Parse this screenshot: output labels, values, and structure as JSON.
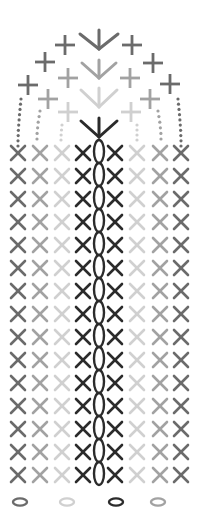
{
  "diagram": {
    "title": "Crochet stitch chart",
    "colors": {
      "darkest": "#2b2b2b",
      "dark": "#6b6b6b",
      "mid": "#a2a2a2",
      "light": "#d0d0d0"
    },
    "symbols": {
      "x": "single-crochet",
      "plus": "single-crochet-variant",
      "v": "increase",
      "chain": "chain-stitch",
      "oval": "chain-loop",
      "dot": "slip-stitch"
    },
    "grid": {
      "rows": 15,
      "first_row_y": 153,
      "row_spacing": 23,
      "x_columns": [
        {
          "x": 18,
          "color": "dark"
        },
        {
          "x": 40,
          "color": "mid"
        },
        {
          "x": 62,
          "color": "light"
        },
        {
          "x": 83,
          "color": "darkest"
        },
        {
          "x": 115,
          "color": "darkest"
        },
        {
          "x": 137,
          "color": "light"
        },
        {
          "x": 160,
          "color": "mid"
        },
        {
          "x": 181,
          "color": "dark"
        }
      ],
      "x_half_size": 7,
      "chain_x": 99,
      "chain_color": "darkest"
    },
    "v_stitches": [
      {
        "cx": 99,
        "top": 30,
        "tip": 49,
        "arm_top": 34,
        "half": 19,
        "color": "dark"
      },
      {
        "cx": 99,
        "top": 60,
        "tip": 78,
        "arm_top": 63,
        "half": 17,
        "color": "mid"
      },
      {
        "cx": 99,
        "top": 88,
        "tip": 107,
        "arm_top": 90,
        "half": 18,
        "color": "light"
      },
      {
        "cx": 99,
        "top": 118,
        "tip": 137,
        "arm_top": 121,
        "half": 18,
        "color": "darkest"
      }
    ],
    "plus_stitches": [
      {
        "x": 65,
        "y": 45,
        "color": "dark"
      },
      {
        "x": 45,
        "y": 62,
        "color": "dark"
      },
      {
        "x": 28,
        "y": 85,
        "color": "dark"
      },
      {
        "x": 132,
        "y": 45,
        "color": "dark"
      },
      {
        "x": 153,
        "y": 63,
        "color": "dark"
      },
      {
        "x": 170,
        "y": 84,
        "color": "dark"
      },
      {
        "x": 68,
        "y": 78,
        "color": "mid"
      },
      {
        "x": 48,
        "y": 99,
        "color": "mid"
      },
      {
        "x": 130,
        "y": 78,
        "color": "mid"
      },
      {
        "x": 150,
        "y": 99,
        "color": "mid"
      },
      {
        "x": 68,
        "y": 112,
        "color": "light"
      },
      {
        "x": 131,
        "y": 112,
        "color": "light"
      }
    ],
    "dot_lines": [
      {
        "x1": 21,
        "y1": 99,
        "x2": 18,
        "y2": 146,
        "count": 10,
        "color": "dark"
      },
      {
        "x1": 178,
        "y1": 99,
        "x2": 181,
        "y2": 146,
        "count": 10,
        "color": "dark"
      },
      {
        "x1": 40,
        "y1": 111,
        "x2": 37,
        "y2": 139,
        "count": 6,
        "color": "mid"
      },
      {
        "x1": 158,
        "y1": 111,
        "x2": 161,
        "y2": 139,
        "count": 6,
        "color": "mid"
      },
      {
        "x1": 62,
        "y1": 125,
        "x2": 61,
        "y2": 140,
        "count": 4,
        "color": "light"
      },
      {
        "x1": 137,
        "y1": 125,
        "x2": 137,
        "y2": 140,
        "count": 4,
        "color": "light"
      }
    ],
    "foundation_ovals": [
      {
        "x": 20,
        "y": 502,
        "color": "dark"
      },
      {
        "x": 67,
        "y": 502,
        "color": "light"
      },
      {
        "x": 116,
        "y": 502,
        "color": "darkest"
      },
      {
        "x": 158,
        "y": 502,
        "color": "mid"
      }
    ]
  }
}
